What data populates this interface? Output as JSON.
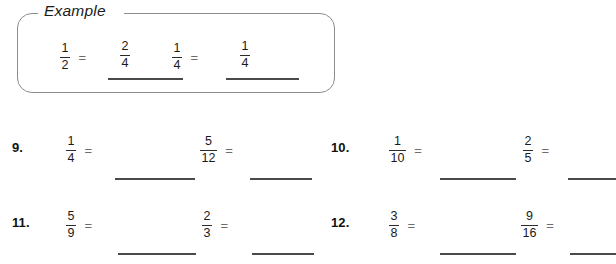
{
  "worksheet": {
    "example": {
      "label": "Example",
      "items": [
        {
          "name": "example-problem-1",
          "fraction": {
            "numerator": "1",
            "denominator": "2"
          },
          "equals": "=",
          "answer": {
            "numerator": "2",
            "denominator": "4"
          }
        },
        {
          "name": "example-problem-2",
          "fraction": {
            "numerator": "1",
            "denominator": "4"
          },
          "equals": "=",
          "answer": {
            "numerator": "1",
            "denominator": "4"
          }
        }
      ]
    },
    "problems": [
      {
        "number": "9.",
        "parts": [
          {
            "fraction": {
              "numerator": "1",
              "denominator": "4"
            },
            "equals": "=",
            "answer": ""
          },
          {
            "fraction": {
              "numerator": "5",
              "denominator": "12"
            },
            "equals": "=",
            "answer": ""
          }
        ]
      },
      {
        "number": "10.",
        "parts": [
          {
            "fraction": {
              "numerator": "1",
              "denominator": "10"
            },
            "equals": "=",
            "answer": ""
          },
          {
            "fraction": {
              "numerator": "2",
              "denominator": "5"
            },
            "equals": "=",
            "answer": ""
          }
        ]
      },
      {
        "number": "11.",
        "parts": [
          {
            "fraction": {
              "numerator": "5",
              "denominator": "9"
            },
            "equals": "=",
            "answer": ""
          },
          {
            "fraction": {
              "numerator": "2",
              "denominator": "3"
            },
            "equals": "=",
            "answer": ""
          }
        ]
      },
      {
        "number": "12.",
        "parts": [
          {
            "fraction": {
              "numerator": "3",
              "denominator": "8"
            },
            "equals": "=",
            "answer": ""
          },
          {
            "fraction": {
              "numerator": "9",
              "denominator": "16"
            },
            "equals": "=",
            "answer": ""
          }
        ]
      }
    ],
    "colors": {
      "box_border": "#8c8c8c",
      "text": "#1a1a1a",
      "equals": "#6e6e6e",
      "blank_line": "#4a4a4a"
    }
  }
}
